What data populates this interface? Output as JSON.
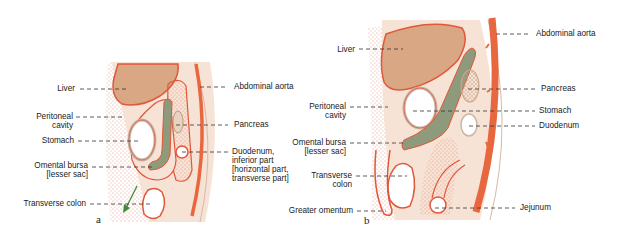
{
  "figure": {
    "panels": [
      {
        "id": "a",
        "letter": "a",
        "labels": {
          "liver": "Liver",
          "peritoneal_cavity_1": "Peritoneal",
          "peritoneal_cavity_2": "cavity",
          "stomach": "Stomach",
          "omental_bursa_1": "Omental bursa",
          "omental_bursa_2": "[lesser sac]",
          "transverse_colon": "Transverse colon",
          "abdominal_aorta": "Abdominal aorta",
          "pancreas": "Pancreas",
          "duodenum_1": "Duodenum,",
          "duodenum_2": "inferior part",
          "duodenum_3": "[horizontal part,",
          "duodenum_4": "transverse part]"
        }
      },
      {
        "id": "b",
        "letter": "b",
        "labels": {
          "liver": "Liver",
          "peritoneal_cavity_1": "Peritoneal",
          "peritoneal_cavity_2": "cavity",
          "omental_bursa_1": "Omental bursa",
          "omental_bursa_2": "[lesser sac]",
          "transverse_colon_1": "Transverse",
          "transverse_colon_2": "colon",
          "greater_omentum": "Greater omentum",
          "abdominal_aorta": "Abdominal aorta",
          "pancreas": "Pancreas",
          "stomach": "Stomach",
          "duodenum": "Duodenum",
          "jejunum": "Jejunum"
        }
      }
    ],
    "colors": {
      "liver": "#d9a783",
      "peritoneum": "#e0573a",
      "tissue": "#f7e3d6",
      "stipple": "#e8826a",
      "omental_bursa": "#8e9a7c",
      "aorta": "#e9673f",
      "arrow": "#3c8a3a"
    }
  }
}
